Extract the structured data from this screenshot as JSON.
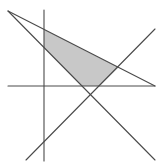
{
  "diagram": {
    "type": "geometric-figure",
    "background": "#ffffff",
    "line_color": "#4a4a4a",
    "fill_color": "#c8c8c8",
    "shaded_region": {
      "points": "44,29.5 118.5,67.5 99.5,86 82,86 44,47.5"
    },
    "lines": [
      {
        "name": "vertical-line",
        "x1": 44,
        "y1": 10,
        "x2": 44,
        "y2": 161
      },
      {
        "name": "horizontal-line",
        "x1": 8,
        "y1": 86,
        "x2": 155,
        "y2": 86
      },
      {
        "name": "top-sloped-line",
        "x1": 8,
        "y1": 11,
        "x2": 155,
        "y2": 86
      },
      {
        "name": "descending-diagonal",
        "x1": 8,
        "y1": 11,
        "x2": 155,
        "y2": 160
      },
      {
        "name": "ascending-diagonal",
        "x1": 26,
        "y1": 160,
        "x2": 155,
        "y2": 29
      }
    ]
  }
}
